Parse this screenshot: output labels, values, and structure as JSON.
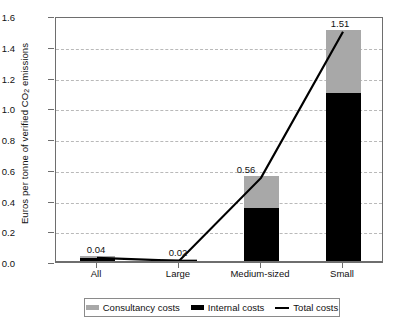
{
  "chart_data": {
    "type": "bar",
    "title": "",
    "xlabel": "",
    "ylabel": "Euros per tonne of verified CO2 emissions",
    "ylabel_pre": "Euros per tonne of verified CO",
    "ylabel_sub": "2",
    "ylabel_post": " emissions",
    "categories": [
      "All",
      "Large",
      "Medium-sized",
      "Small"
    ],
    "ylim": [
      0.0,
      1.6
    ],
    "ytick_values": [
      0.0,
      0.2,
      0.4,
      0.6,
      0.8,
      1.0,
      1.2,
      1.4,
      1.6
    ],
    "ytick_labels": [
      "0.0",
      "0.2",
      "0.4",
      "0.6",
      "0.8",
      "1.0",
      "1.2",
      "1.4",
      "1.6"
    ],
    "grid": true,
    "legend_position": "bottom",
    "series": [
      {
        "name": "Internal costs",
        "type": "bar",
        "color": "#000000",
        "values": [
          0.025,
          0.012,
          0.35,
          1.1
        ]
      },
      {
        "name": "Consultancy costs",
        "type": "bar",
        "color": "#a8a8a8",
        "values": [
          0.015,
          0.008,
          0.21,
          0.41
        ]
      },
      {
        "name": "Total costs",
        "type": "line",
        "color": "#000000",
        "values": [
          0.04,
          0.02,
          0.56,
          1.51
        ]
      }
    ],
    "data_labels": [
      "0.04",
      "0.02",
      "0.56",
      "1.51"
    ]
  },
  "legend": {
    "items": [
      {
        "label": "Consultancy costs",
        "swatch": "consultancy-swatch"
      },
      {
        "label": "Internal costs",
        "swatch": "internal-swatch"
      },
      {
        "label": "Total costs",
        "swatch": "total-line-swatch"
      }
    ]
  },
  "colors": {
    "consultancy": "#a8a8a8",
    "internal": "#000000",
    "total_line": "#000000",
    "grid": "#b9b9b9",
    "axis": "#6e6e6e"
  }
}
